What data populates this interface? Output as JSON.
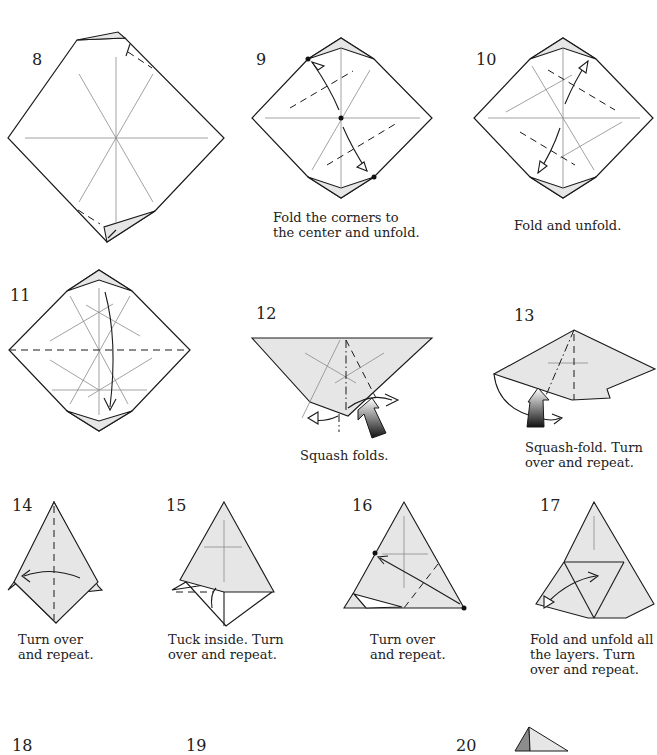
{
  "steps": [
    {
      "number": "8",
      "caption": ""
    },
    {
      "number": "9",
      "caption": "Fold the corners to\nthe center and unfold."
    },
    {
      "number": "10",
      "caption": "Fold and unfold."
    },
    {
      "number": "11",
      "caption": ""
    },
    {
      "number": "12",
      "caption": "Squash folds."
    },
    {
      "number": "13",
      "caption": "Squash-fold. Turn\nover and repeat."
    },
    {
      "number": "14",
      "caption": "Turn over\nand repeat."
    },
    {
      "number": "15",
      "caption": "Tuck inside. Turn\nover and repeat."
    },
    {
      "number": "16",
      "caption": "Turn over\nand repeat."
    },
    {
      "number": "17",
      "caption": "Fold and unfold all\nthe layers. Turn\nover and repeat."
    },
    {
      "number": "18",
      "caption": ""
    },
    {
      "number": "19",
      "caption": ""
    },
    {
      "number": "20",
      "caption": ""
    }
  ],
  "colors": {
    "paper": "#ffffff",
    "paper_colored": "#e6e6e6",
    "line": "#1a1a1a",
    "crease": "#8a8a8a"
  }
}
